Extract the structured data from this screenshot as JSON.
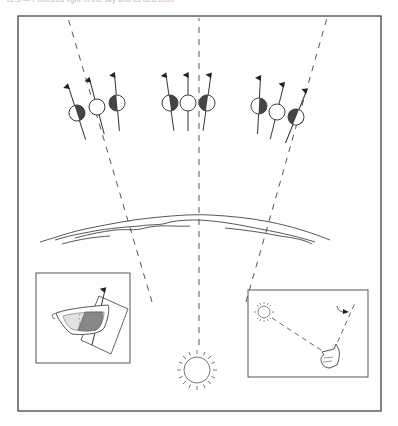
{
  "caption": "12.5 — Polarized light in the sky and its detection",
  "colors": {
    "stroke": "#333333",
    "dash": "#555555",
    "fill_dark": "#444444",
    "fill_light": "#dcdcdc",
    "background": "#ffffff"
  },
  "frame": {
    "x": 18,
    "y": 16,
    "width": 363,
    "height": 395
  },
  "rays": [
    {
      "name": "left-ray",
      "from": [
        150,
        300
      ],
      "to": [
        68,
        20
      ]
    },
    {
      "name": "center-ray",
      "from": [
        199,
        345
      ],
      "to": [
        199,
        20
      ]
    },
    {
      "name": "right-ray",
      "from": [
        250,
        300
      ],
      "to": [
        325,
        20
      ]
    }
  ],
  "polarization_groups": [
    {
      "name": "left",
      "markers": [
        {
          "cx": 77,
          "cy": 113,
          "angle": -18,
          "shade": "right"
        },
        {
          "cx": 96,
          "cy": 106,
          "angle": -15,
          "shade": "none"
        },
        {
          "cx": 118,
          "cy": 103,
          "angle": -5,
          "shade": "left"
        }
      ]
    },
    {
      "name": "center",
      "markers": [
        {
          "cx": 168,
          "cy": 103,
          "angle": -8,
          "shade": "right"
        },
        {
          "cx": 188,
          "cy": 103,
          "angle": 0,
          "shade": "none"
        },
        {
          "cx": 208,
          "cy": 103,
          "angle": 8,
          "shade": "left"
        }
      ]
    },
    {
      "name": "right",
      "markers": [
        {
          "cx": 259,
          "cy": 105,
          "angle": 4,
          "shade": "right"
        },
        {
          "cx": 276,
          "cy": 111,
          "angle": 15,
          "shade": "none"
        },
        {
          "cx": 296,
          "cy": 117,
          "angle": 22,
          "shade": "left"
        }
      ]
    }
  ],
  "horizon": {
    "label": "atmosphere-horizon"
  },
  "inset_left": {
    "x": 36,
    "y": 273,
    "width": 94,
    "height": 90,
    "label": "polarizing-sunglasses"
  },
  "inset_right": {
    "x": 248,
    "y": 290,
    "width": 120,
    "height": 87,
    "label": "sun-direction-pointing"
  },
  "sun": {
    "cx": 197,
    "cy": 370,
    "r": 14
  }
}
